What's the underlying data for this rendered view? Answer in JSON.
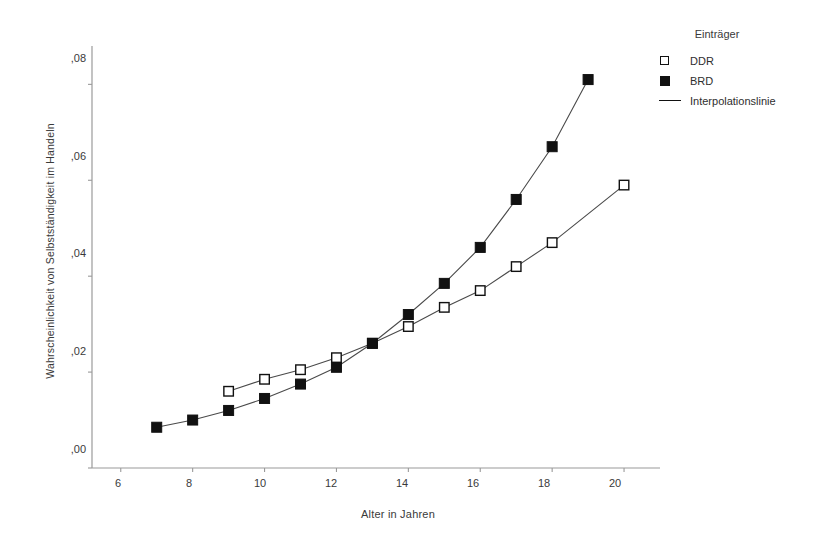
{
  "chart_data": {
    "type": "line",
    "title": "",
    "xlabel": "Alter in Jahren",
    "ylabel": "Wahrscheinlichkeit von Selbstständigkeit im Handeln",
    "xlim": [
      5.2,
      21.0
    ],
    "ylim": [
      0.0,
      0.088
    ],
    "xticks": [
      6,
      8,
      10,
      12,
      14,
      16,
      18,
      20
    ],
    "xtick_labels": [
      "6",
      "8",
      "10",
      "12",
      "14",
      "16",
      "18",
      "20"
    ],
    "yticks": [
      0.0,
      0.02,
      0.04,
      0.06,
      0.08
    ],
    "ytick_labels": [
      ",00",
      ",02",
      ",04",
      ",06",
      ",08"
    ],
    "grid": false,
    "legend_position": "right",
    "legend_title": "Einträger",
    "legend_entries": [
      {
        "label": "DDR",
        "marker": "open-square"
      },
      {
        "label": "BRD",
        "marker": "filled-square"
      },
      {
        "label": "Interpolationslinie",
        "marker": "line"
      }
    ],
    "series": [
      {
        "name": "DDR",
        "marker": "open-square",
        "x": [
          9,
          10,
          11,
          12,
          13,
          14,
          15,
          16,
          17,
          18,
          20
        ],
        "values": [
          0.016,
          0.0185,
          0.0205,
          0.023,
          0.026,
          0.0295,
          0.0335,
          0.037,
          0.042,
          0.047,
          0.059
        ]
      },
      {
        "name": "BRD",
        "marker": "filled-square",
        "x": [
          7,
          8,
          9,
          10,
          11,
          12,
          13,
          14,
          15,
          16,
          17,
          18,
          19
        ],
        "values": [
          0.0085,
          0.01,
          0.012,
          0.0145,
          0.0175,
          0.021,
          0.026,
          0.032,
          0.0385,
          0.046,
          0.056,
          0.067,
          0.081
        ]
      }
    ]
  }
}
